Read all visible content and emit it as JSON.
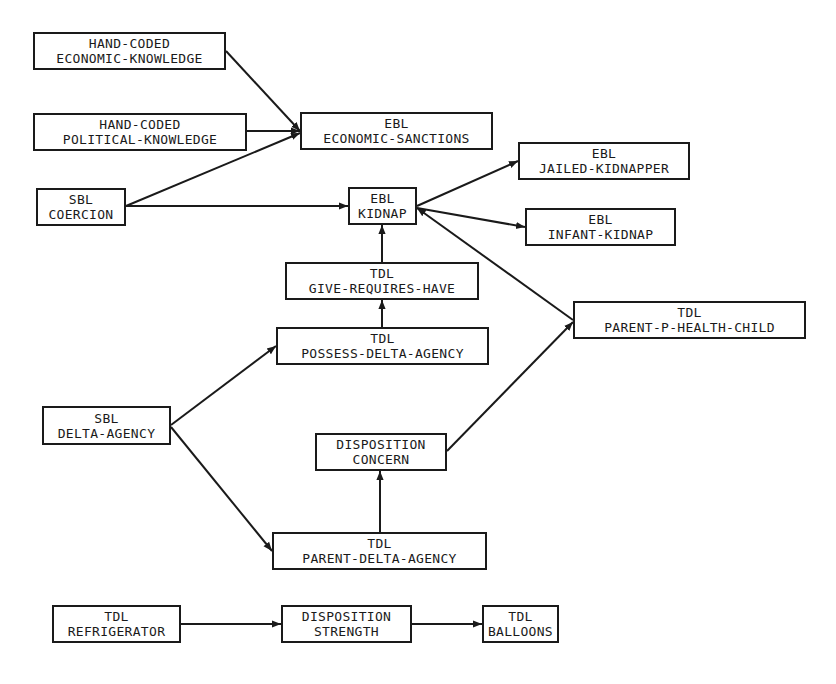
{
  "diagram": {
    "nodes": [
      {
        "id": "hc-econ",
        "line1": "HAND-CODED",
        "line2": "ECONOMIC-KNOWLEDGE",
        "x": 33,
        "y": 32,
        "w": 193,
        "h": 38
      },
      {
        "id": "hc-pol",
        "line1": "HAND-CODED",
        "line2": "POLITICAL-KNOWLEDGE",
        "x": 33,
        "y": 113,
        "w": 214,
        "h": 38
      },
      {
        "id": "sbl-coercion",
        "line1": "SBL",
        "line2": "COERCION",
        "x": 36,
        "y": 188,
        "w": 90,
        "h": 38
      },
      {
        "id": "ebl-econ-sanctions",
        "line1": "EBL",
        "line2": "ECONOMIC-SANCTIONS",
        "x": 300,
        "y": 112,
        "w": 193,
        "h": 38
      },
      {
        "id": "ebl-kidnap",
        "line1": "EBL",
        "line2": "KIDNAP",
        "x": 348,
        "y": 187,
        "w": 69,
        "h": 38
      },
      {
        "id": "ebl-jailed",
        "line1": "EBL",
        "line2": "JAILED-KIDNAPPER",
        "x": 518,
        "y": 142,
        "w": 172,
        "h": 38
      },
      {
        "id": "ebl-infant",
        "line1": "EBL",
        "line2": "INFANT-KIDNAP",
        "x": 525,
        "y": 208,
        "w": 151,
        "h": 38
      },
      {
        "id": "tdl-give",
        "line1": "TDL",
        "line2": "GIVE-REQUIRES-HAVE",
        "x": 285,
        "y": 262,
        "w": 194,
        "h": 38
      },
      {
        "id": "tdl-possess",
        "line1": "TDL",
        "line2": "POSSESS-DELTA-AGENCY",
        "x": 276,
        "y": 327,
        "w": 213,
        "h": 38
      },
      {
        "id": "tdl-parent-health",
        "line1": "TDL",
        "line2": "PARENT-P-HEALTH-CHILD",
        "x": 573,
        "y": 301,
        "w": 233,
        "h": 38
      },
      {
        "id": "sbl-delta",
        "line1": "SBL",
        "line2": "DELTA-AGENCY",
        "x": 42,
        "y": 406,
        "w": 129,
        "h": 39
      },
      {
        "id": "disp-concern",
        "line1": "DISPOSITION",
        "line2": "CONCERN",
        "x": 315,
        "y": 433,
        "w": 132,
        "h": 38
      },
      {
        "id": "tdl-parent-delta",
        "line1": "TDL",
        "line2": "PARENT-DELTA-AGENCY",
        "x": 272,
        "y": 532,
        "w": 215,
        "h": 38
      },
      {
        "id": "tdl-fridge",
        "line1": "TDL",
        "line2": "REFRIGERATOR",
        "x": 52,
        "y": 605,
        "w": 129,
        "h": 38
      },
      {
        "id": "disp-strength",
        "line1": "DISPOSITION",
        "line2": "STRENGTH",
        "x": 281,
        "y": 605,
        "w": 131,
        "h": 38
      },
      {
        "id": "tdl-balloons",
        "line1": "TDL",
        "line2": "BALLOONS",
        "x": 482,
        "y": 605,
        "w": 77,
        "h": 38
      }
    ],
    "edges": [
      {
        "from": "hc-econ",
        "to": "ebl-econ-sanctions",
        "x1": 226,
        "y1": 51,
        "x2": 300,
        "y2": 131
      },
      {
        "from": "hc-pol",
        "to": "ebl-econ-sanctions",
        "x1": 247,
        "y1": 131,
        "x2": 300,
        "y2": 131
      },
      {
        "from": "sbl-coercion",
        "to": "ebl-econ-sanctions",
        "x1": 126,
        "y1": 206,
        "x2": 300,
        "y2": 133
      },
      {
        "from": "sbl-coercion",
        "to": "ebl-kidnap",
        "x1": 126,
        "y1": 206,
        "x2": 348,
        "y2": 206
      },
      {
        "from": "ebl-kidnap",
        "to": "ebl-jailed",
        "x1": 417,
        "y1": 206,
        "x2": 518,
        "y2": 161
      },
      {
        "from": "ebl-kidnap",
        "to": "ebl-infant",
        "x1": 417,
        "y1": 208,
        "x2": 525,
        "y2": 227
      },
      {
        "from": "tdl-parent-health",
        "to": "ebl-kidnap",
        "x1": 573,
        "y1": 320,
        "x2": 417,
        "y2": 208
      },
      {
        "from": "tdl-give",
        "to": "ebl-kidnap",
        "x1": 382,
        "y1": 262,
        "x2": 382,
        "y2": 225
      },
      {
        "from": "tdl-possess",
        "to": "tdl-give",
        "x1": 382,
        "y1": 327,
        "x2": 382,
        "y2": 300
      },
      {
        "from": "sbl-delta",
        "to": "tdl-possess",
        "x1": 171,
        "y1": 425,
        "x2": 276,
        "y2": 346
      },
      {
        "from": "sbl-delta",
        "to": "tdl-parent-delta",
        "x1": 171,
        "y1": 427,
        "x2": 272,
        "y2": 551
      },
      {
        "from": "tdl-parent-delta",
        "to": "disp-concern",
        "x1": 380,
        "y1": 532,
        "x2": 380,
        "y2": 471
      },
      {
        "from": "disp-concern",
        "to": "tdl-parent-health",
        "x1": 447,
        "y1": 451,
        "x2": 573,
        "y2": 322
      },
      {
        "from": "tdl-fridge",
        "to": "disp-strength",
        "x1": 181,
        "y1": 624,
        "x2": 281,
        "y2": 624
      },
      {
        "from": "disp-strength",
        "to": "tdl-balloons",
        "x1": 412,
        "y1": 624,
        "x2": 482,
        "y2": 624
      }
    ],
    "colors": {
      "stroke": "#1a1a1a",
      "background": "#ffffff"
    }
  }
}
